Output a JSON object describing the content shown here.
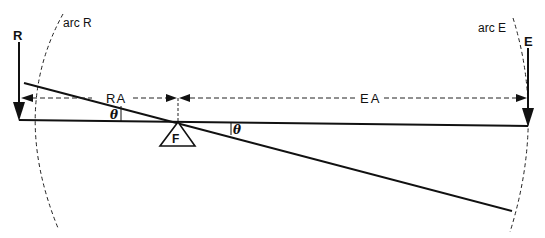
{
  "diagram": {
    "type": "lever diagram",
    "labels": {
      "resistance": "R",
      "effort": "E",
      "arc_resistance": "arc R",
      "arc_effort": "arc E",
      "resistance_arm": "RA",
      "effort_arm": "EA",
      "fulcrum": "F",
      "angle_left": "θ",
      "angle_right": "θ"
    },
    "colors": {
      "stroke": "#111111",
      "background": "#ffffff"
    }
  }
}
